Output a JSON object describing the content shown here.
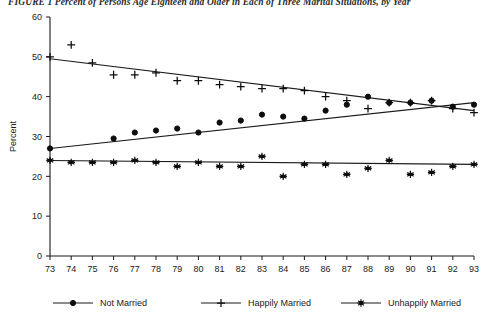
{
  "figure": {
    "title": "FIGURE 1  Percent of Persons Age Eighteen and Older in Each of Three Marital Situations, by Year"
  },
  "legend": {
    "position": "bottom",
    "items": [
      {
        "label": "Not Married",
        "marker": "filled-circle-marker"
      },
      {
        "label": "Happily Married",
        "marker": "plus-cross-marker"
      },
      {
        "label": "Unhappily Married",
        "marker": "asterisk-star-marker"
      }
    ]
  },
  "axes": {
    "y_title": "Percent",
    "x_title": "Year",
    "y_ticks": [
      "0",
      "10",
      "20",
      "30",
      "40",
      "50",
      "60"
    ],
    "x_ticks": [
      "73",
      "74",
      "75",
      "76",
      "77",
      "78",
      "79",
      "80",
      "81",
      "82",
      "83",
      "84",
      "85",
      "86",
      "87",
      "88",
      "89",
      "90",
      "91",
      "92",
      "93"
    ]
  },
  "chart_data": {
    "type": "scatter",
    "title": "FIGURE 1  Percent of Persons Age Eighteen and Older in Each of Three Marital Situations, by Year",
    "xlabel": "Year",
    "ylabel": "Percent",
    "xlim": [
      73,
      93
    ],
    "ylim": [
      0,
      60
    ],
    "grid": false,
    "legend_position": "bottom",
    "x": [
      73,
      74,
      75,
      76,
      77,
      78,
      79,
      80,
      81,
      82,
      83,
      84,
      85,
      86,
      87,
      88,
      89,
      90,
      91,
      92,
      93
    ],
    "series": [
      {
        "name": "Not Married",
        "marker": "filled-circle-marker",
        "values": [
          27.0,
          null,
          null,
          29.5,
          31.0,
          31.5,
          32.0,
          31.0,
          33.5,
          34.0,
          35.5,
          35.0,
          34.5,
          36.5,
          38.0,
          40.0,
          38.5,
          38.5,
          39.0,
          37.5,
          38.0
        ],
        "trend": {
          "start": 27.0,
          "end": 38.5
        }
      },
      {
        "name": "Happily Married",
        "marker": "plus-cross-marker",
        "values": [
          50.0,
          53.0,
          48.5,
          45.5,
          45.5,
          46.0,
          44.0,
          44.0,
          43.0,
          42.5,
          42.0,
          42.0,
          41.5,
          40.0,
          39.0,
          37.0,
          38.5,
          38.5,
          39.0,
          37.0,
          36.0
        ],
        "trend": {
          "start": 49.5,
          "end": 36.5
        }
      },
      {
        "name": "Unhappily Married",
        "marker": "asterisk-star-marker",
        "values": [
          24.0,
          23.5,
          23.5,
          23.5,
          24.0,
          23.5,
          22.5,
          23.5,
          22.5,
          22.5,
          25.0,
          20.0,
          23.0,
          23.0,
          20.5,
          22.0,
          24.0,
          20.5,
          21.0,
          22.5,
          23.0
        ],
        "trend": {
          "start": 24.0,
          "end": 23.0
        }
      }
    ]
  }
}
